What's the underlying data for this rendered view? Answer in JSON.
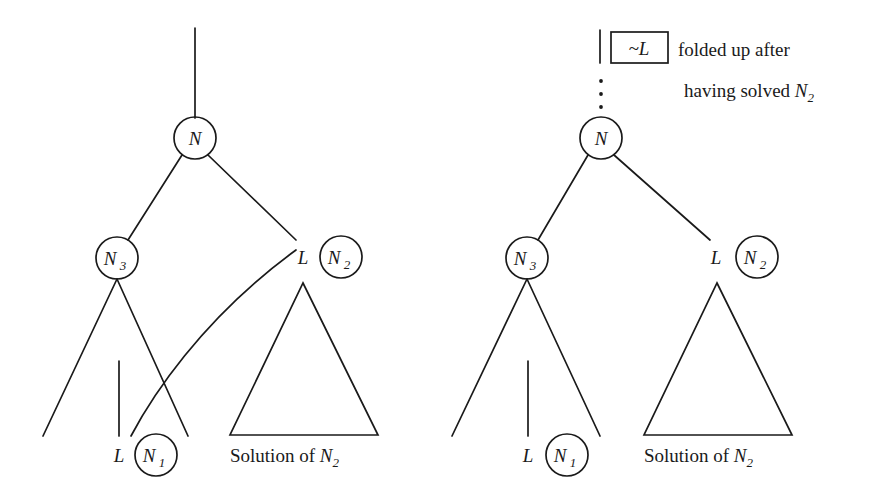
{
  "figure": {
    "type": "proof-tree-diagram",
    "background_color": "#ffffff",
    "ink_color": "#1a1a1a",
    "panels": [
      {
        "id": "left",
        "name": "before-folding-up",
        "root_label": "N",
        "left_child_label": "N",
        "left_child_sub": "3",
        "right_literal_label": "L",
        "right_child_label": "N",
        "right_child_sub": "2",
        "leaf_literal_label": "L",
        "leaf_node_label": "N",
        "leaf_node_sub": "1",
        "triangle_caption_text": "Solution of ",
        "triangle_caption_math": "N",
        "triangle_caption_sub": "2",
        "has_connection_arc": true
      },
      {
        "id": "right",
        "name": "after-folding-up",
        "root_label": "N",
        "left_child_label": "N",
        "left_child_sub": "3",
        "right_literal_label": "L",
        "right_child_label": "N",
        "right_child_sub": "2",
        "leaf_literal_label": "L",
        "leaf_node_label": "N",
        "leaf_node_sub": "1",
        "triangle_caption_text": "Solution of ",
        "triangle_caption_math": "N",
        "triangle_caption_sub": "2",
        "has_connection_arc": false
      }
    ],
    "annotation": {
      "boxed_symbol_tilde": "~",
      "boxed_symbol_literal": "L",
      "line1": "folded up after",
      "line2_text": "having solved ",
      "line2_math": "N",
      "line2_sub": "2",
      "has_dotted_stem": true,
      "dot_count": 3
    }
  }
}
